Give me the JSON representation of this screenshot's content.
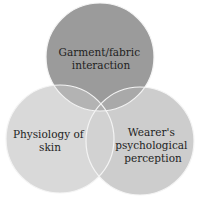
{
  "diagram": {
    "type": "venn",
    "circles": [
      {
        "id": "top",
        "label_lines": [
          "Garment/fabric",
          "interaction"
        ],
        "fill": "#9b9b9b"
      },
      {
        "id": "left",
        "label_lines": [
          "Physiology of",
          "skin"
        ],
        "fill": "#d9d9d9"
      },
      {
        "id": "right",
        "label_lines": [
          "Wearer's",
          "psychological",
          "perception"
        ],
        "fill": "#cdcdcd"
      }
    ],
    "overlap_colors": {
      "top_left": "#b3b3b3",
      "top_right": "#a9a9a9",
      "left_right": "#d2d2d2",
      "all": "#b0b0b0"
    },
    "border_color": "#f4f4f4"
  }
}
